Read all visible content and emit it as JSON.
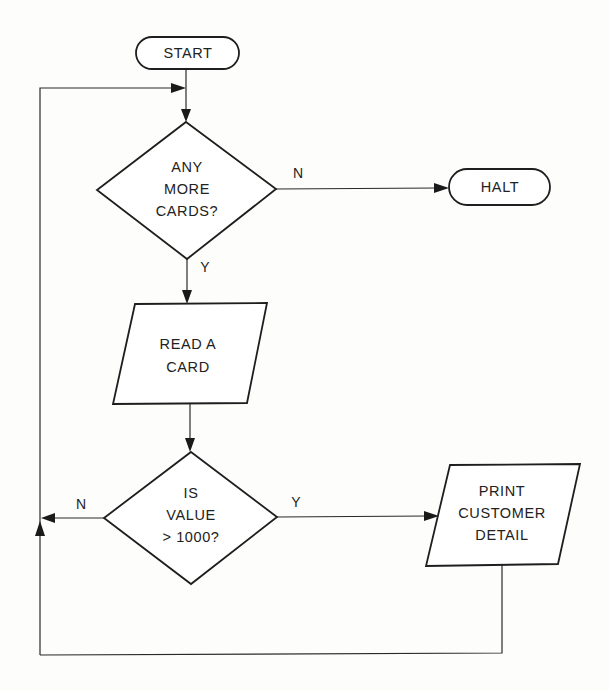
{
  "diagram": {
    "type": "flowchart",
    "colors": {
      "line": "#1e1e1e",
      "background": "#fdfdfc",
      "text": "#222222"
    },
    "nodes": [
      {
        "id": "start",
        "shape": "terminator",
        "lines": [
          "START"
        ]
      },
      {
        "id": "decision_more_cards",
        "shape": "decision",
        "lines": [
          "ANY",
          "MORE",
          "CARDS?"
        ]
      },
      {
        "id": "halt",
        "shape": "terminator",
        "lines": [
          "HALT"
        ]
      },
      {
        "id": "read_card",
        "shape": "input-output",
        "lines": [
          "READ A",
          "CARD"
        ]
      },
      {
        "id": "decision_value",
        "shape": "decision",
        "lines": [
          "IS",
          "VALUE",
          "> 1000?"
        ]
      },
      {
        "id": "print_detail",
        "shape": "input-output",
        "lines": [
          "PRINT",
          "CUSTOMER",
          "DETAIL"
        ]
      }
    ],
    "edges": [
      {
        "from": "start",
        "to": "decision_more_cards",
        "label": ""
      },
      {
        "from": "decision_more_cards",
        "to": "halt",
        "label": "N"
      },
      {
        "from": "decision_more_cards",
        "to": "read_card",
        "label": "Y"
      },
      {
        "from": "read_card",
        "to": "decision_value",
        "label": ""
      },
      {
        "from": "decision_value",
        "to": "print_detail",
        "label": "Y"
      },
      {
        "from": "decision_value",
        "to": "decision_more_cards",
        "label": "N"
      },
      {
        "from": "print_detail",
        "to": "decision_more_cards",
        "label": ""
      }
    ],
    "labels": {
      "more_cards_no": "N",
      "more_cards_yes": "Y",
      "value_no": "N",
      "value_yes": "Y"
    }
  }
}
